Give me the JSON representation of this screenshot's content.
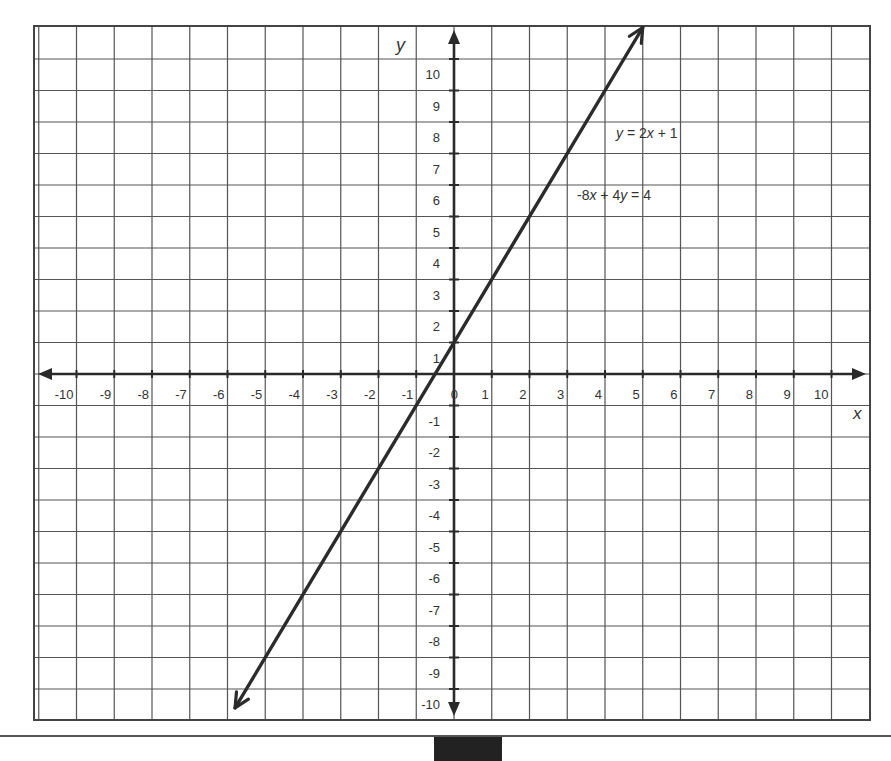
{
  "chart_data": {
    "type": "line",
    "title": "",
    "xlabel": "x",
    "ylabel": "y",
    "xlim": [
      -11,
      11
    ],
    "ylim": [
      -11,
      11
    ],
    "grid": true,
    "x_ticks": [
      -10,
      -9,
      -8,
      -7,
      -6,
      -5,
      -4,
      -3,
      -2,
      -1,
      0,
      1,
      2,
      3,
      4,
      5,
      6,
      7,
      8,
      9,
      10
    ],
    "y_ticks": [
      -10,
      -9,
      -8,
      -7,
      -6,
      -5,
      -4,
      -3,
      -2,
      -1,
      1,
      2,
      3,
      4,
      5,
      6,
      7,
      8,
      9,
      10
    ],
    "x_tick_labels": [
      "-10",
      "-9",
      "-8",
      "-7",
      "-6",
      "-5",
      "-4",
      "-3",
      "-2",
      "-1",
      "0",
      "1",
      "2",
      "3",
      "4",
      "5",
      "6",
      "7",
      "8",
      "9",
      "10"
    ],
    "y_tick_labels": [
      "10",
      "9",
      "8",
      "7",
      "6",
      "5",
      "4",
      "3",
      "2",
      "1",
      "-1",
      "-2",
      "-3",
      "-4",
      "-5",
      "-6",
      "-7",
      "-8",
      "-9",
      "-10"
    ],
    "series": [
      {
        "name": "y = 2x + 1",
        "equation_alt": "-8x + 4y = 4",
        "x": [
          -5.8,
          5.0
        ],
        "y": [
          -10.6,
          11.0
        ],
        "arrows": "both"
      }
    ],
    "annotations": [
      {
        "text_parts": [
          "y",
          " = 2",
          "x",
          " + 1"
        ],
        "position": [
          4.5,
          8
        ]
      },
      {
        "text_parts": [
          "-8",
          "x",
          " + 4",
          "y",
          " = 4"
        ],
        "position": [
          3.3,
          6
        ]
      }
    ]
  },
  "colors": {
    "grid": "#555555",
    "axis": "#2a2a2a",
    "line": "#2b2b2b",
    "text": "#333333",
    "background": "#ffffff"
  }
}
